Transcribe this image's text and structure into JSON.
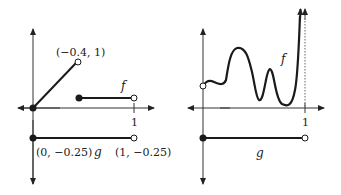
{
  "left_graph": {
    "point_label_top": "(−0.4, 1)",
    "f_label": "f",
    "tick_label": "1",
    "g_start_label": "(0, −0.25)",
    "g_label": "g",
    "g_end_label": "(1, −0.25)"
  },
  "right_graph": {
    "f_label": "f",
    "tick_label": "1",
    "g_label": "g"
  },
  "colors": {
    "stroke": "#1a1a1a",
    "axis": "#333333",
    "background": "#ffffff"
  }
}
